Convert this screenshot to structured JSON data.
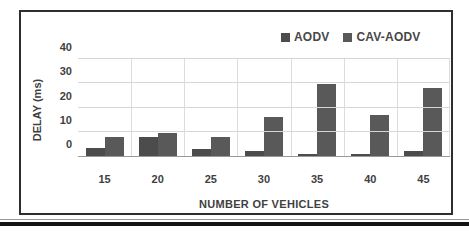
{
  "chart_data": {
    "type": "bar",
    "title": "",
    "categories": [
      "15",
      "20",
      "25",
      "30",
      "35",
      "40",
      "45"
    ],
    "series": [
      {
        "name": "AODV",
        "color": "#4c4c4c",
        "values": [
          3.5,
          8,
          3,
          2,
          1,
          1,
          2
        ]
      },
      {
        "name": "CAV-AODV",
        "color": "#595959",
        "values": [
          8,
          9.5,
          8,
          16,
          29.5,
          17,
          28
        ]
      }
    ],
    "xlabel": "NUMBER OF VEHICLES",
    "ylabel": "DELAY (ms)",
    "ylim": [
      0,
      40
    ],
    "yticks": [
      0,
      10,
      20,
      30,
      40
    ],
    "legend_position": "top-right-inside",
    "grid": true,
    "gridline_color": "#d6d6d6"
  }
}
